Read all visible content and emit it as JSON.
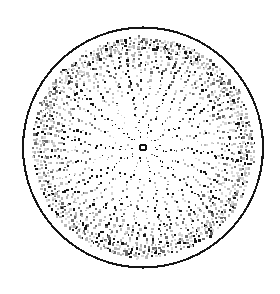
{
  "figure": {
    "title": "Radial dot distribution diagram",
    "background_color": "#ffffff"
  },
  "canvas": {
    "width": 280,
    "height": 294
  },
  "boundary_circle": {
    "name": "outer-boundary-circle",
    "center_x": 143,
    "center_y": 147.5,
    "radius": 120,
    "stroke_color": "#151515",
    "stroke_width": 2.1,
    "fill": "none"
  },
  "center_marker": {
    "name": "center-ring-marker",
    "center_x": 143,
    "center_y": 147.5,
    "outer_radius": 4.1,
    "inner_radius": 2.0,
    "stroke_color": "#101010",
    "stroke_width": 1.9,
    "fill": "none"
  },
  "dot_field": {
    "inner_blank_radius": 11,
    "outer_dot_radius": 112,
    "ring_count": 30,
    "ring_spacing": 3.38,
    "base_spokes": 10,
    "spoke_split_radii": [
      30,
      52,
      74,
      94
    ],
    "dot_shape": "square",
    "dot_min_size": 0.9,
    "dot_max_size": 2.6,
    "dot_dark_color": "#151515",
    "dot_mid_color": "#6e6e6e",
    "dot_light_color": "#b8b8b8",
    "dot_faint_color": "#d8d8d8",
    "spoke_angular_jitter": 0.055,
    "radial_jitter": 1.25,
    "seed": 20231104
  },
  "chart_data": {
    "type": "scatter",
    "title": "Radial dot distribution diagram",
    "xlabel": "",
    "ylabel": "",
    "coordinate_system": "polar",
    "grid": false,
    "legend": null,
    "annotations": [
      "central open ring marker at origin",
      "heavy circular boundary at radius 120 px",
      "dot density increases with radius as spokes bifurcate"
    ],
    "axis_ranges": {
      "r": [
        11,
        112
      ],
      "theta_degrees": [
        0,
        360
      ]
    },
    "series": [
      {
        "name": "radial spoke dots",
        "description": "Dots arranged along radial spokes that repeatedly bifurcate outward, over 30 concentric rings.",
        "ring_radii": [
          11.0,
          14.4,
          17.8,
          21.1,
          24.5,
          27.9,
          31.3,
          34.6,
          38.0,
          41.4,
          44.8,
          48.1,
          51.5,
          54.9,
          58.3,
          61.6,
          65.0,
          68.4,
          71.8,
          75.1,
          78.5,
          81.9,
          85.3,
          88.6,
          92.0,
          95.4,
          98.8,
          102.1,
          105.5,
          108.9
        ],
        "dots_per_ring": [
          10,
          10,
          10,
          10,
          10,
          10,
          20,
          20,
          20,
          20,
          20,
          20,
          20,
          40,
          40,
          40,
          40,
          40,
          40,
          40,
          80,
          80,
          80,
          80,
          80,
          80,
          160,
          160,
          160,
          160
        ],
        "approx_total_points": 1810
      }
    ]
  }
}
